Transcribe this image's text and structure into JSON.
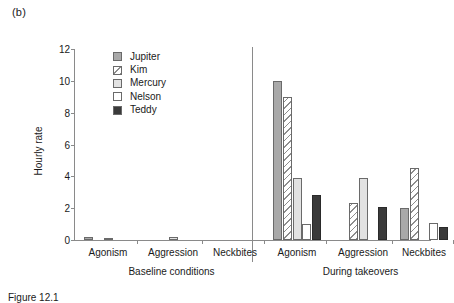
{
  "figure": {
    "panel_label": "(b)",
    "caption": "Figure 12.1"
  },
  "chart_data": {
    "type": "bar",
    "title": "",
    "xlabel": "",
    "ylabel": "Hourly rate",
    "ylim": [
      0,
      12
    ],
    "yticks": [
      0,
      2,
      4,
      6,
      8,
      10,
      12
    ],
    "grid": false,
    "legend_position": "upper-left-inside",
    "group_labels": [
      "Baseline conditions",
      "During takeovers"
    ],
    "categories": [
      "Agonism",
      "Aggression",
      "Neckbites"
    ],
    "series": [
      {
        "name": "Jupiter",
        "color": "#a9a9a9",
        "pattern": "solid-gray",
        "values_baseline": [
          0.2,
          0.0,
          0.0
        ],
        "values_takeover": [
          10.0,
          0.0,
          2.0
        ]
      },
      {
        "name": "Kim",
        "color": "#ffffff",
        "pattern": "diagonal-hatch",
        "values_baseline": [
          0.0,
          0.0,
          0.0
        ],
        "values_takeover": [
          9.0,
          2.3,
          4.5
        ]
      },
      {
        "name": "Mercury",
        "color": "#e2e2e2",
        "pattern": "solid-light-gray",
        "values_baseline": [
          0.15,
          0.2,
          0.0
        ],
        "values_takeover": [
          3.9,
          3.9,
          0.0
        ]
      },
      {
        "name": "Nelson",
        "color": "#ffffff",
        "pattern": "solid-white",
        "values_baseline": [
          0.0,
          0.0,
          0.0
        ],
        "values_takeover": [
          1.0,
          0.0,
          1.1
        ]
      },
      {
        "name": "Teddy",
        "color": "#3a3a3a",
        "pattern": "solid-dark",
        "values_baseline": [
          0.0,
          0.0,
          0.0
        ],
        "values_takeover": [
          2.8,
          2.1,
          0.8
        ]
      }
    ]
  }
}
